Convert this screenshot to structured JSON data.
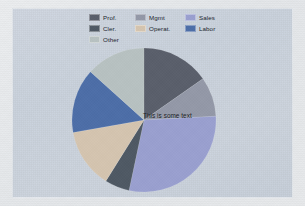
{
  "figure": {
    "background_color": "#e9eaec",
    "panel_color": "#cbd2dd",
    "center_annotation": "This is some text"
  },
  "legend": {
    "position": "top",
    "columns": 3,
    "entries": [
      {
        "label": "Prof.",
        "color": "#5a5f6b",
        "column": 1,
        "row": 1
      },
      {
        "label": "Mgmt",
        "color": "#9499a8",
        "column": 2,
        "row": 1
      },
      {
        "label": "Sales",
        "color": "#9aa0d0",
        "column": 3,
        "row": 1
      },
      {
        "label": "Cler.",
        "color": "#4f5964",
        "column": 1,
        "row": 2
      },
      {
        "label": "Operat.",
        "color": "#d5c5b0",
        "column": 2,
        "row": 2
      },
      {
        "label": "Labor",
        "color": "#4d6ea8",
        "column": 3,
        "row": 2
      },
      {
        "label": "Other",
        "color": "#b8c2c2",
        "column": 1,
        "row": 3
      }
    ]
  },
  "chart_data": {
    "type": "pie",
    "title": "",
    "xlabel": "",
    "ylabel": "",
    "start_angle_deg": 90,
    "direction": "clockwise",
    "annotations": [
      "This is some text"
    ],
    "legend_position": "top",
    "categories": [
      "Prof.",
      "Mgmt",
      "Sales",
      "Cler.",
      "Operat.",
      "Labor",
      "Other"
    ],
    "values": [
      55,
      32,
      105,
      20,
      48,
      52,
      48
    ],
    "units": "degrees",
    "percentages": [
      15.3,
      8.9,
      29.2,
      5.6,
      13.3,
      14.4,
      13.3
    ],
    "colors": [
      "#5a5f6b",
      "#9499a8",
      "#9aa0d0",
      "#4f5964",
      "#d5c5b0",
      "#4d6ea8",
      "#b8c2c2"
    ],
    "slices": [
      {
        "label": "Prof.",
        "color": "#5a5f6b",
        "angle_deg": 55,
        "percent": 15.3,
        "start_deg": 0,
        "end_deg": 55
      },
      {
        "label": "Mgmt",
        "color": "#9499a8",
        "angle_deg": 32,
        "percent": 8.9,
        "start_deg": 55,
        "end_deg": 87
      },
      {
        "label": "Sales",
        "color": "#9aa0d0",
        "angle_deg": 105,
        "percent": 29.2,
        "start_deg": 87,
        "end_deg": 192
      },
      {
        "label": "Cler.",
        "color": "#4f5964",
        "angle_deg": 20,
        "percent": 5.6,
        "start_deg": 192,
        "end_deg": 212
      },
      {
        "label": "Operat.",
        "color": "#d5c5b0",
        "angle_deg": 48,
        "percent": 13.3,
        "start_deg": 212,
        "end_deg": 260
      },
      {
        "label": "Labor",
        "color": "#4d6ea8",
        "angle_deg": 52,
        "percent": 14.4,
        "start_deg": 260,
        "end_deg": 312
      },
      {
        "label": "Other",
        "color": "#b8c2c2",
        "angle_deg": 48,
        "percent": 13.3,
        "start_deg": 312,
        "end_deg": 360
      }
    ]
  }
}
